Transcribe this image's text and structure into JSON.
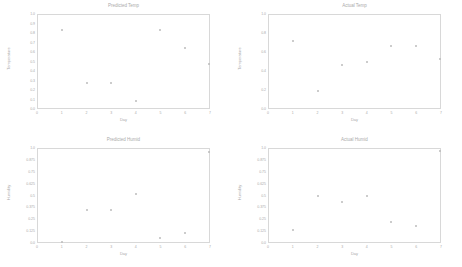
{
  "chart_data": [
    {
      "type": "scatter",
      "title": "Predicted Temp",
      "xlabel": "Day",
      "ylabel": "Temperature",
      "xlim": [
        0,
        7
      ],
      "ylim": [
        0.0,
        1.0
      ],
      "x_ticks": [
        "0",
        "1",
        "2",
        "3",
        "4",
        "5",
        "6",
        "7"
      ],
      "y_ticks": [
        "1.0",
        "0.9",
        "0.8",
        "0.7",
        "0.6",
        "0.5",
        "0.4",
        "0.3",
        "0.2",
        "0.1",
        "0.0"
      ],
      "grid": false,
      "x": [
        1,
        2,
        3,
        4,
        5,
        6,
        7
      ],
      "y": [
        0.84,
        0.27,
        0.27,
        0.08,
        0.84,
        0.64,
        0.47
      ]
    },
    {
      "type": "scatter",
      "title": "Actual Temp",
      "xlabel": "Day",
      "ylabel": "Temperature",
      "xlim": [
        0,
        7
      ],
      "ylim": [
        0.0,
        1.0
      ],
      "x_ticks": [
        "0",
        "1",
        "2",
        "3",
        "4",
        "5",
        "6",
        "7"
      ],
      "y_ticks": [
        "1.0",
        "0.8",
        "0.6",
        "0.4",
        "0.2",
        "0.0"
      ],
      "grid": false,
      "x": [
        1,
        2,
        3,
        4,
        5,
        6,
        7
      ],
      "y": [
        0.72,
        0.18,
        0.46,
        0.5,
        0.67,
        0.67,
        0.53
      ]
    },
    {
      "type": "scatter",
      "title": "Predicted Humid",
      "xlabel": "Day",
      "ylabel": "Humidity",
      "xlim": [
        0,
        7
      ],
      "ylim": [
        0.0,
        1.0
      ],
      "x_ticks": [
        "0",
        "1",
        "2",
        "3",
        "4",
        "5",
        "6",
        "7"
      ],
      "y_ticks": [
        "1.0",
        "0.875",
        "0.75",
        "0.625",
        "0.5",
        "0.375",
        "0.25",
        "0.125",
        "0.0"
      ],
      "grid": false,
      "x": [
        1,
        2,
        3,
        4,
        5,
        6,
        7
      ],
      "y": [
        0.0,
        0.34,
        0.34,
        0.52,
        0.04,
        0.1,
        0.97
      ]
    },
    {
      "type": "scatter",
      "title": "Actual Humid",
      "xlabel": "Day",
      "ylabel": "Humidity",
      "xlim": [
        0,
        7
      ],
      "ylim": [
        0.0,
        1.0
      ],
      "x_ticks": [
        "0",
        "1",
        "2",
        "3",
        "4",
        "5",
        "6",
        "7"
      ],
      "y_ticks": [
        "1.0",
        "0.875",
        "0.75",
        "0.625",
        "0.5",
        "0.375",
        "0.25",
        "0.125",
        "0.0"
      ],
      "grid": false,
      "x": [
        1,
        2,
        3,
        4,
        5,
        6,
        7
      ],
      "y": [
        0.13,
        0.5,
        0.43,
        0.49,
        0.21,
        0.17,
        0.98
      ]
    }
  ]
}
